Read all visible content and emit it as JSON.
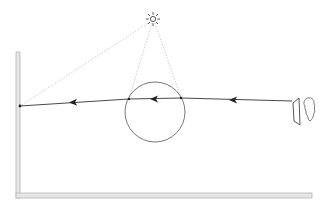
{
  "diagram": {
    "title": "",
    "elements": {
      "sun": {
        "icon": "sun-icon",
        "cx": 153,
        "cy": 19
      },
      "droplet": {
        "shape": "circle",
        "cx": 155,
        "cy": 112,
        "r": 30
      },
      "wall": {
        "orientation": "vertical",
        "x": 16,
        "y_top": 52,
        "y_bottom": 198
      },
      "floor": {
        "orientation": "horizontal",
        "y": 194,
        "x_left": 16,
        "x_right": 312
      },
      "observer": {
        "icon": "eye-face-icon",
        "screen_icon": "viewing-card-icon"
      },
      "sight_line": {
        "from": [
          292,
          101
        ],
        "to": [
          20,
          106
        ],
        "arrow_direction": "left"
      },
      "wall_point": {
        "x": 20,
        "y": 106
      }
    },
    "colors": {
      "line": "#333333",
      "dotted": "#999999",
      "wall_fill": "#e6e6e6",
      "wall_stroke": "#b5b5b5",
      "circle": "#555555"
    }
  }
}
